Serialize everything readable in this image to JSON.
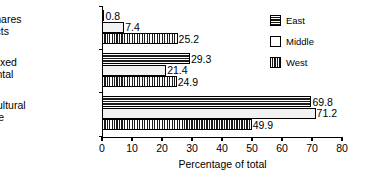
{
  "chart_data": {
    "type": "bar",
    "orientation": "horizontal",
    "title": "",
    "xlabel": "Percentage of total",
    "ylabel": "",
    "xlim": [
      0,
      80
    ],
    "xticks": [
      0,
      10,
      20,
      30,
      40,
      50,
      60,
      70,
      80
    ],
    "xtick_labels": [
      "0",
      "10",
      "20",
      "30",
      "40",
      "50",
      "60",
      "70",
      "80"
    ],
    "grid": false,
    "legend_position": "top-right",
    "categories": [
      "Rents for shares of products",
      "Rents for fixed money rental",
      "Not on agricultural schedule"
    ],
    "category_lines": [
      [
        "Rents for shares",
        "of products"
      ],
      [
        "Rents for fixed",
        "money rental"
      ],
      [
        "Not on agricultural",
        "schedule"
      ]
    ],
    "series": [
      {
        "name": "East",
        "pattern": "horizontal-lines",
        "values": [
          0.8,
          29.3,
          69.8
        ],
        "labels": [
          "0.8",
          "29.3",
          "69.8"
        ]
      },
      {
        "name": "Middle",
        "pattern": "solid-white",
        "values": [
          7.4,
          21.4,
          71.2
        ],
        "labels": [
          "7.4",
          "21.4",
          "71.2"
        ]
      },
      {
        "name": "West",
        "pattern": "vertical-lines",
        "values": [
          25.2,
          24.9,
          49.9
        ],
        "labels": [
          "25.2",
          "24.9",
          "49.9"
        ]
      }
    ]
  },
  "legend": {
    "items": [
      {
        "label": "East"
      },
      {
        "label": "Middle"
      },
      {
        "label": "West"
      }
    ]
  },
  "colors": {
    "axis": "#000000",
    "text": "#000000",
    "background": "#ffffff",
    "bar_fill_dark": "#1c1c1c",
    "bar_fill_light": "#f2f2f2"
  }
}
